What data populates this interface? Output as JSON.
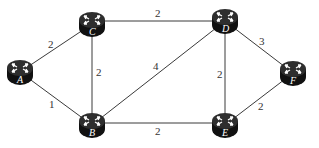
{
  "diagram": {
    "type": "network-graph",
    "node_icon": "router-icon",
    "colors": {
      "router_body": "#1a1a1a",
      "router_top": "#3a3a3a",
      "edge": "#3a3a3a",
      "text": "#333333"
    },
    "nodes": [
      {
        "id": "A",
        "label": "A",
        "x": 20,
        "y": 72
      },
      {
        "id": "B",
        "label": "B",
        "x": 92,
        "y": 125
      },
      {
        "id": "C",
        "label": "C",
        "x": 92,
        "y": 24
      },
      {
        "id": "D",
        "label": "D",
        "x": 225,
        "y": 21
      },
      {
        "id": "E",
        "label": "E",
        "x": 225,
        "y": 125
      },
      {
        "id": "F",
        "label": "F",
        "x": 293,
        "y": 73
      }
    ],
    "edges": [
      {
        "from": "A",
        "to": "C",
        "weight": "2"
      },
      {
        "from": "A",
        "to": "B",
        "weight": "1"
      },
      {
        "from": "C",
        "to": "B",
        "weight": "2"
      },
      {
        "from": "C",
        "to": "D",
        "weight": "2"
      },
      {
        "from": "B",
        "to": "D",
        "weight": "4"
      },
      {
        "from": "B",
        "to": "E",
        "weight": "2"
      },
      {
        "from": "D",
        "to": "E",
        "weight": "2"
      },
      {
        "from": "D",
        "to": "F",
        "weight": "3"
      },
      {
        "from": "E",
        "to": "F",
        "weight": "2"
      }
    ]
  }
}
